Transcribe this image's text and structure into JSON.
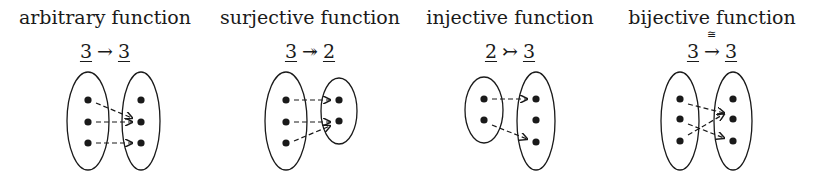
{
  "panels": [
    {
      "title": "arbitrary function",
      "domain": "3",
      "arrow": "→",
      "codomain": "3",
      "iso_label": "",
      "domain_size": 3,
      "codomain_size": 3,
      "mapping": [
        1,
        1,
        2
      ]
    },
    {
      "title": "surjective function",
      "domain": "3",
      "arrow": "↠",
      "codomain": "2",
      "iso_label": "",
      "domain_size": 3,
      "codomain_size": 2,
      "mapping": [
        0,
        1,
        1
      ]
    },
    {
      "title": "injective function",
      "domain": "2",
      "arrow": "↣",
      "codomain": "3",
      "iso_label": "",
      "domain_size": 2,
      "codomain_size": 3,
      "mapping": [
        0,
        2
      ]
    },
    {
      "title": "bijective function",
      "domain": "3",
      "arrow": "→",
      "codomain": "3",
      "iso_label": "≅",
      "domain_size": 3,
      "codomain_size": 3,
      "mapping": [
        1,
        2,
        0
      ]
    }
  ],
  "colors": {
    "ink": "#1a1a1a",
    "background": "#ffffff"
  }
}
